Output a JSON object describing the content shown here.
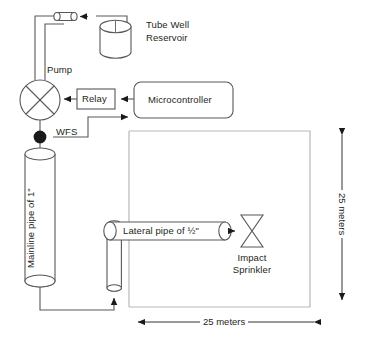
{
  "diagram": {
    "components": {
      "tube_well_reservoir": {
        "label_line1": "Tube Well",
        "label_line2": "Reservoir",
        "shape": "cylinder-vertical"
      },
      "pump": {
        "label": "Pump",
        "shape": "circle-with-cross"
      },
      "relay": {
        "label": "Relay",
        "shape": "rectangle"
      },
      "microcontroller": {
        "label": "Microcontroller",
        "shape": "rounded-rectangle"
      },
      "water_flow_sensor": {
        "label": "WFS",
        "shape": "filled-circle"
      },
      "mainline_pipe": {
        "label": "Mainline pipe of 1\"",
        "shape": "cylinder-vertical",
        "orientation": "vertical-rotated-text"
      },
      "lateral_pipe": {
        "label": "Lateral pipe of ½\"",
        "shape": "cylinder-horizontal"
      },
      "impact_sprinkler": {
        "label_line1": "Impact",
        "label_line2": "Sprinkler",
        "shape": "bowtie-valve"
      },
      "delivery_pipe": {
        "label": "",
        "shape": "cylinder-horizontal-small"
      },
      "riser_pipe": {
        "label": "",
        "shape": "cylinder-vertical-small"
      }
    },
    "field": {
      "label": "irrigation field boundary",
      "width_dimension": "25 meters",
      "height_dimension": "25 meters"
    },
    "dimensions": {
      "horizontal": "25 meters",
      "vertical": "25 meters"
    },
    "colors": {
      "stroke": "#58585a",
      "field_stroke": "#b6b7b9",
      "text": "#231f20",
      "sensor_fill": "#1a1a1a",
      "background": "#ffffff"
    }
  }
}
